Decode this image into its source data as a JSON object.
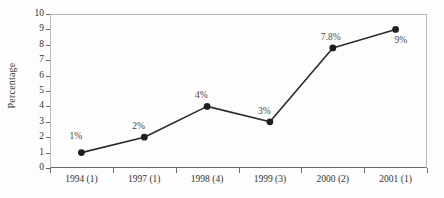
{
  "chart_data": {
    "type": "line",
    "title": "",
    "xlabel": "",
    "ylabel": "Percentage",
    "ylim": [
      0,
      10
    ],
    "grid": false,
    "legend": "none",
    "categories": [
      "1994 (1)",
      "1997 (1)",
      "1998 (4)",
      "1999 (3)",
      "2000 (2)",
      "2001 (1)"
    ],
    "values": [
      1,
      2,
      4,
      3,
      7.8,
      9
    ],
    "point_labels": [
      "1%",
      "2%",
      "4%",
      "3%",
      "7.8%",
      "9%"
    ],
    "ytick_labels": [
      "0",
      "1",
      "2",
      "3",
      "4",
      "5",
      "6",
      "7",
      "8",
      "9",
      "10"
    ],
    "series_color": "#2b2b2b",
    "marker": "circle",
    "marker_color": "#1f1f1f",
    "axis_color": "#6a6a6a",
    "frame_color": "#b9b9b9",
    "label_color": "#4a4a4a",
    "background": "#fdfdfd"
  }
}
